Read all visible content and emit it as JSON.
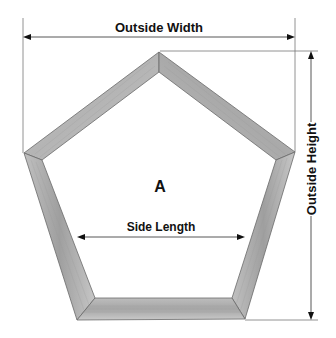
{
  "diagram": {
    "labels": {
      "outside_width": "Outside Width",
      "outside_height": "Outside Height",
      "side_length": "Side Length",
      "center": "A"
    },
    "colors": {
      "background": "#ffffff",
      "wood_light": "#c9c9c9",
      "wood_mid": "#b0b0b0",
      "wood_dark": "#8e8e8e",
      "line": "#555555",
      "text": "#111111"
    }
  }
}
